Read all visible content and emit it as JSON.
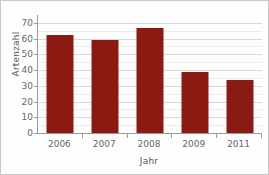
{
  "chart_data": {
    "type": "bar",
    "title": "",
    "subtitle": "",
    "categories": [
      "2006",
      "2007",
      "2008",
      "2009",
      "2011"
    ],
    "values": [
      62,
      59,
      67,
      39,
      34
    ],
    "xlabel": "Jahr",
    "ylabel": "Artenzahl",
    "ylim": [
      0,
      75
    ],
    "ytick_values": [
      0,
      10,
      20,
      30,
      40,
      50,
      60,
      70
    ],
    "ytick_labels": [
      "0",
      "10",
      "20",
      "30",
      "40",
      "50",
      "60",
      "70"
    ],
    "minor_tick_step": 5,
    "grid": true,
    "grid_axis": "y",
    "legend": false,
    "legend_position": "none",
    "series": [
      {
        "name": "Artenzahl",
        "values": [
          62,
          59,
          67,
          39,
          34
        ]
      }
    ],
    "annotations": []
  },
  "style": {
    "bar_color": "#8B1A13",
    "grid_color": "#d9d9d9",
    "minor_grid_color": "#ebebeb",
    "axis_color": "#9a9a9a",
    "tick_label_color": "#666666",
    "axis_title_color": "#555555",
    "background_color": "#fefefe",
    "border_color": "#c8c8c8"
  }
}
